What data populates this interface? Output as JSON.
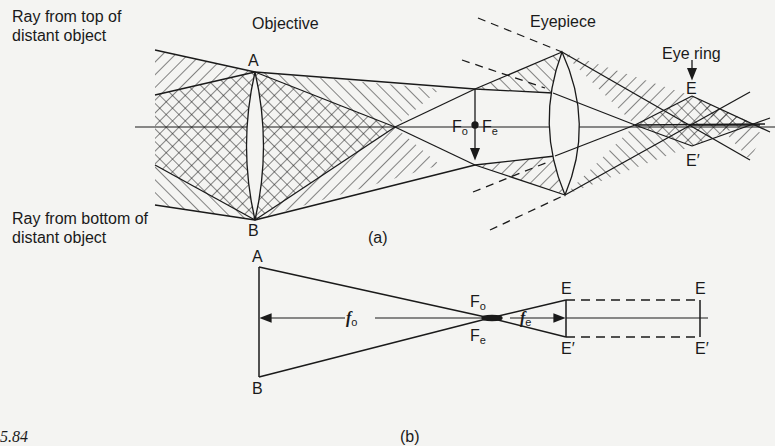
{
  "figure": {
    "caption_fragment": "5.84",
    "part_a": {
      "label": "(a)",
      "ray_top_label": [
        "Ray from top of",
        "distant object"
      ],
      "ray_bottom_label": [
        "Ray from bottom of",
        "distant object"
      ],
      "objective_label": "Objective",
      "eyepiece_label": "Eyepiece",
      "eye_ring_label": "Eye ring",
      "point_A": "A",
      "point_B": "B",
      "point_E": "E",
      "point_E_prime": "E′",
      "focus_o": {
        "main": "F",
        "sub": "o"
      },
      "focus_e": {
        "main": "F",
        "sub": "e"
      }
    },
    "part_b": {
      "label": "(b)",
      "point_A": "A",
      "point_B": "B",
      "point_E": "E",
      "point_E_prime": "E′",
      "point_E2": "E",
      "point_E2_prime": "E′",
      "focal_o": {
        "main": "f",
        "sub": "o"
      },
      "focal_e": {
        "main": "f",
        "sub": "e"
      },
      "focus_o": {
        "main": "F",
        "sub": "o"
      },
      "focus_e": {
        "main": "F",
        "sub": "e"
      }
    }
  }
}
